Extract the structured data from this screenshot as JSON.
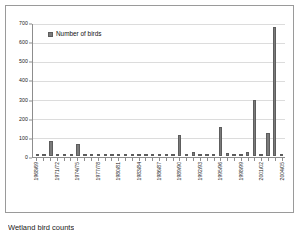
{
  "figure": {
    "background_color": "#ffffff",
    "frame_color": "#9a9a9a",
    "caption": "Wetland bird counts"
  },
  "legend": {
    "position": "inside-top-left",
    "swatch_name": "legend-swatch",
    "label": "Number of birds",
    "color": "#7b7b7b"
  },
  "chart_data": {
    "type": "bar",
    "title": "",
    "subtitle": "",
    "xlabel": "",
    "ylabel": "",
    "ylim": [
      0,
      700
    ],
    "yticks": [
      0,
      100,
      200,
      300,
      400,
      500,
      600,
      700
    ],
    "ytick_labels": [
      "0",
      "100",
      "200",
      "300",
      "400",
      "500",
      "600",
      "700"
    ],
    "grid": true,
    "grid_axis": "y",
    "bar_color": "#7b7b7b",
    "bar_edge_color": "#5d5d5d",
    "legend": [
      "Number of birds"
    ],
    "label_interval": 3,
    "categories": [
      "1968/69",
      "1969/70",
      "1970/71",
      "1971/72",
      "1972/73",
      "1973/74",
      "1974/75",
      "1975/76",
      "1976/77",
      "1977/78",
      "1978/79",
      "1979/80",
      "1980/81",
      "1981/82",
      "1982/83",
      "1983/84",
      "1984/85",
      "1985/86",
      "1986/87",
      "1987/88",
      "1988/89",
      "1989/90",
      "1990/91",
      "1991/92",
      "1992/93",
      "1993/94",
      "1994/95",
      "1995/96",
      "1996/97",
      "1997/98",
      "1998/99",
      "1999/00",
      "2000/01",
      "2001/02",
      "2002/03",
      "2003/04",
      "2004/05"
    ],
    "tick_labels_shown": [
      "1968/69",
      "1971/72",
      "1974/75",
      "1977/78",
      "1980/81",
      "1983/84",
      "1986/87",
      "1989/90",
      "1992/93",
      "1995/96",
      "1998/99",
      "2001/02",
      "2004/05"
    ],
    "series": [
      {
        "name": "Number of birds",
        "values": [
          4,
          0,
          80,
          10,
          2,
          4,
          65,
          6,
          0,
          0,
          0,
          3,
          0,
          1,
          1,
          0,
          0,
          0,
          2,
          4,
          0,
          112,
          3,
          22,
          2,
          0,
          7,
          152,
          16,
          2,
          0,
          20,
          295,
          3,
          120,
          685,
          3
        ]
      }
    ]
  }
}
